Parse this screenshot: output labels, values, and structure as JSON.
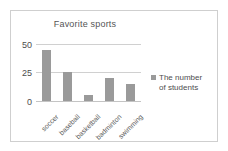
{
  "chart_data": {
    "type": "bar",
    "title": "Favorite sports",
    "xlabel": "",
    "ylabel": "",
    "categories": [
      "soccer",
      "baseball",
      "basketball",
      "badminton",
      "swimming"
    ],
    "values": [
      45,
      25,
      5,
      20,
      15
    ],
    "series": [
      {
        "name": "The number of students",
        "values": [
          45,
          25,
          5,
          20,
          15
        ]
      }
    ],
    "ylim": [
      0,
      50
    ],
    "yticks": [
      0,
      25,
      50
    ],
    "ytick_labels": [
      "0",
      "25",
      "50"
    ],
    "grid": true,
    "legend_position": "right",
    "legend_entries": [
      "The number of students"
    ],
    "bar_color": "#9a9a9a",
    "gridline_color": "#d0d0d0",
    "text_color": "#4d4d4d",
    "frame_color": "#cfcfcf",
    "background": "#ffffff"
  },
  "legend": {
    "line1": "The number",
    "line2": "of students"
  }
}
